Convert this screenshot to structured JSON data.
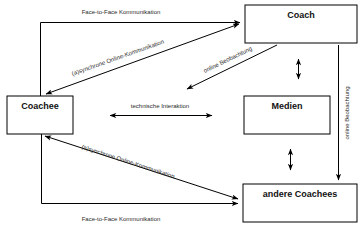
{
  "diagram": {
    "background_color": "#ffffff",
    "line_color": "#000000",
    "label_color": "#2a2a2a",
    "nodes": [
      {
        "id": "coach",
        "label": "Coach"
      },
      {
        "id": "coachee",
        "label": "Coachee"
      },
      {
        "id": "medien",
        "label": "Medien"
      },
      {
        "id": "andere_coachees",
        "label": "andere Coachees"
      }
    ],
    "edge_labels": [
      {
        "id": "top-face-to-face",
        "text": "Face-to-Face Kommunikation"
      },
      {
        "id": "upper-online-komm",
        "text": "(a)synchrone Online-Kommunikation"
      },
      {
        "id": "online-beobachtung-diag",
        "text": "online Beobachtung"
      },
      {
        "id": "online-beobachtung-vert",
        "text": "online Beobachtung"
      },
      {
        "id": "technische-interaktion",
        "text": "technische Interaktion"
      },
      {
        "id": "lower-online-komm",
        "text": "(a)synchrone Online-Kommunikation"
      },
      {
        "id": "bottom-face-to-face",
        "text": "Face-to-Face Kommunikation"
      }
    ]
  }
}
